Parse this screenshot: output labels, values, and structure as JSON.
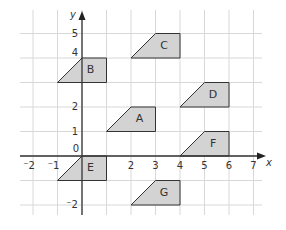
{
  "diagram": {
    "type": "coordinate-grid",
    "axes": {
      "x_label": "x",
      "y_label": "y"
    },
    "x_range": [
      -2,
      7
    ],
    "y_range": [
      -2,
      5
    ],
    "x_ticks": [
      {
        "value": -2,
        "label": "⁻2"
      },
      {
        "value": -1,
        "label": "⁻1"
      },
      {
        "value": 2,
        "label": "2"
      },
      {
        "value": 3,
        "label": "3"
      },
      {
        "value": 4,
        "label": "4"
      },
      {
        "value": 5,
        "label": "5"
      },
      {
        "value": 6,
        "label": "6"
      },
      {
        "value": 7,
        "label": "7"
      }
    ],
    "y_ticks": [
      {
        "value": 5,
        "label": "5"
      },
      {
        "value": 4,
        "label": "4"
      },
      {
        "value": 2,
        "label": "2"
      },
      {
        "value": 1,
        "label": "1"
      },
      {
        "value": -2,
        "label": "⁻2"
      }
    ],
    "origin_label": "0",
    "shape_fill": "#d3d3d3",
    "shapes": [
      {
        "label": "A",
        "vertices": [
          [
            1,
            1
          ],
          [
            2,
            2
          ],
          [
            3,
            2
          ],
          [
            3,
            1
          ]
        ]
      },
      {
        "label": "B",
        "vertices": [
          [
            -1,
            3
          ],
          [
            0,
            4
          ],
          [
            1,
            4
          ],
          [
            1,
            3
          ]
        ]
      },
      {
        "label": "C",
        "vertices": [
          [
            2,
            4
          ],
          [
            3,
            5
          ],
          [
            4,
            5
          ],
          [
            4,
            4
          ]
        ]
      },
      {
        "label": "D",
        "vertices": [
          [
            4,
            2
          ],
          [
            5,
            3
          ],
          [
            6,
            3
          ],
          [
            6,
            2
          ]
        ]
      },
      {
        "label": "E",
        "vertices": [
          [
            -1,
            -1
          ],
          [
            0,
            0
          ],
          [
            1,
            0
          ],
          [
            1,
            -1
          ]
        ]
      },
      {
        "label": "F",
        "vertices": [
          [
            4,
            0
          ],
          [
            5,
            1
          ],
          [
            6,
            1
          ],
          [
            6,
            0
          ]
        ]
      },
      {
        "label": "G",
        "vertices": [
          [
            2,
            -2
          ],
          [
            3,
            -1
          ],
          [
            4,
            -1
          ],
          [
            4,
            -2
          ]
        ]
      }
    ]
  }
}
